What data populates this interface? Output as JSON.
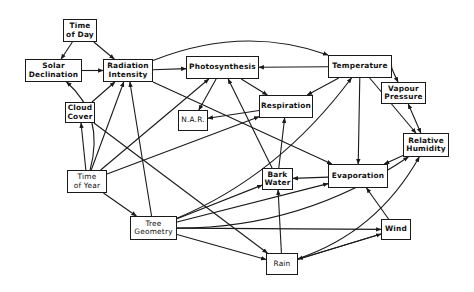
{
  "diagram": {
    "title": "",
    "nodes": [
      {
        "id": "time_of_day",
        "label": "Time\nof Day"
      },
      {
        "id": "solar_declination",
        "label": "Solar\nDeclination"
      },
      {
        "id": "radiation_intensity",
        "label": "Radiation\nIntensity"
      },
      {
        "id": "photosynthesis",
        "label": "Photosynthesis"
      },
      {
        "id": "temperature",
        "label": "Temperature"
      },
      {
        "id": "vapour_pressure",
        "label": "Vapour\nPressure"
      },
      {
        "id": "cloud_cover",
        "label": "Cloud\nCover"
      },
      {
        "id": "nar",
        "label": "N.A.R."
      },
      {
        "id": "respiration",
        "label": "Respiration"
      },
      {
        "id": "relative_humidity",
        "label": "Relative\nHumidity"
      },
      {
        "id": "time_of_year",
        "label": "Time\nof Year"
      },
      {
        "id": "bark_water",
        "label": "Bark\nWater"
      },
      {
        "id": "evaporation",
        "label": "Evaporation"
      },
      {
        "id": "tree_geometry",
        "label": "Tree\nGeometry"
      },
      {
        "id": "wind",
        "label": "Wind"
      },
      {
        "id": "rain",
        "label": "Rain"
      }
    ],
    "edges": [
      {
        "from": "time_of_day",
        "to": "solar_declination"
      },
      {
        "from": "time_of_day",
        "to": "radiation_intensity"
      },
      {
        "from": "solar_declination",
        "to": "radiation_intensity"
      },
      {
        "from": "radiation_intensity",
        "to": "photosynthesis"
      },
      {
        "from": "radiation_intensity",
        "to": "temperature"
      },
      {
        "from": "radiation_intensity",
        "to": "evaporation"
      },
      {
        "from": "cloud_cover",
        "to": "radiation_intensity"
      },
      {
        "from": "cloud_cover",
        "to": "rain"
      },
      {
        "from": "time_of_year",
        "to": "solar_declination"
      },
      {
        "from": "time_of_year",
        "to": "cloud_cover"
      },
      {
        "from": "time_of_year",
        "to": "radiation_intensity"
      },
      {
        "from": "time_of_year",
        "to": "photosynthesis"
      },
      {
        "from": "time_of_year",
        "to": "respiration"
      },
      {
        "from": "time_of_year",
        "to": "tree_geometry"
      },
      {
        "from": "tree_geometry",
        "to": "radiation_intensity"
      },
      {
        "from": "tree_geometry",
        "to": "bark_water"
      },
      {
        "from": "tree_geometry",
        "to": "evaporation"
      },
      {
        "from": "tree_geometry",
        "to": "temperature"
      },
      {
        "from": "tree_geometry",
        "to": "relative_humidity"
      },
      {
        "from": "tree_geometry",
        "to": "wind"
      },
      {
        "from": "tree_geometry",
        "to": "rain"
      },
      {
        "from": "photosynthesis",
        "to": "nar"
      },
      {
        "from": "photosynthesis",
        "to": "respiration"
      },
      {
        "from": "temperature",
        "to": "photosynthesis"
      },
      {
        "from": "temperature",
        "to": "respiration"
      },
      {
        "from": "temperature",
        "to": "vapour_pressure"
      },
      {
        "from": "temperature",
        "to": "relative_humidity"
      },
      {
        "from": "temperature",
        "to": "evaporation"
      },
      {
        "from": "vapour_pressure",
        "to": "relative_humidity",
        "bidirectional": true
      },
      {
        "from": "respiration",
        "to": "nar"
      },
      {
        "from": "relative_humidity",
        "to": "evaporation"
      },
      {
        "from": "evaporation",
        "to": "bark_water"
      },
      {
        "from": "bark_water",
        "to": "photosynthesis"
      },
      {
        "from": "bark_water",
        "to": "respiration"
      },
      {
        "from": "wind",
        "to": "evaporation"
      },
      {
        "from": "wind",
        "to": "rain"
      },
      {
        "from": "rain",
        "to": "bark_water"
      },
      {
        "from": "rain",
        "to": "relative_humidity"
      },
      {
        "from": "rain",
        "to": "wind"
      }
    ]
  }
}
